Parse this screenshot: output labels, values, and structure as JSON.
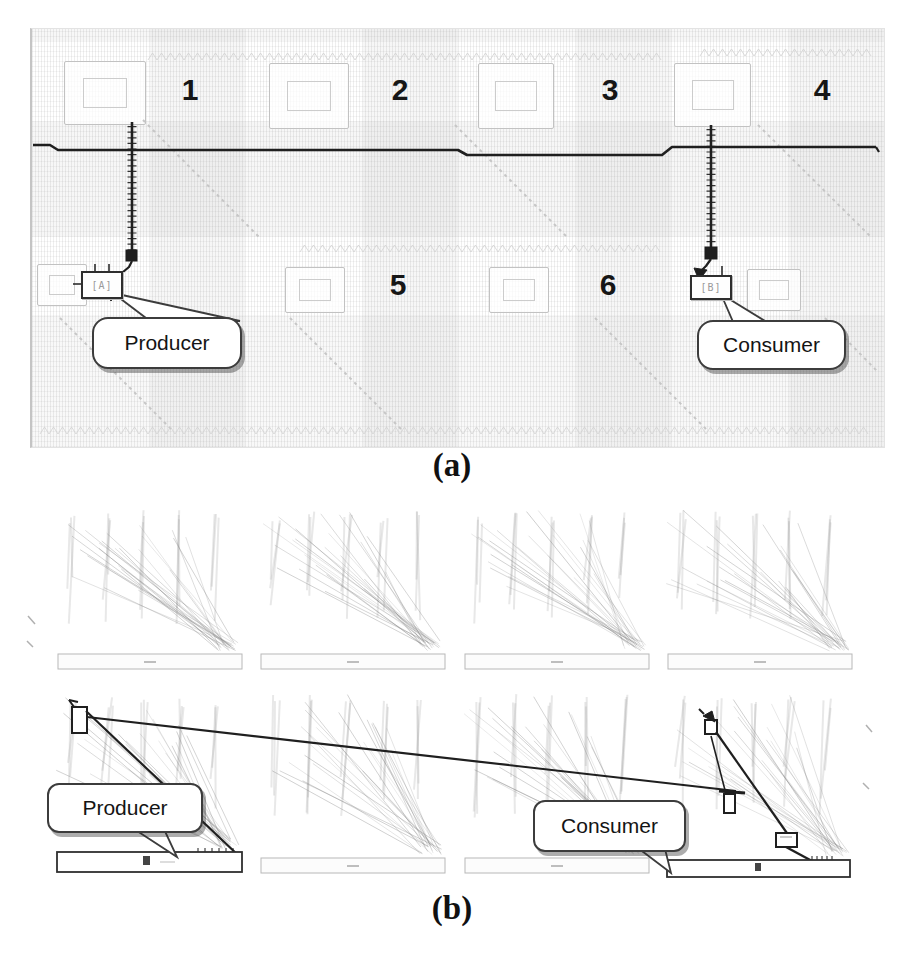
{
  "panel_a": {
    "tag": "(a)",
    "numbers": [
      "1",
      "2",
      "3",
      "4",
      "5",
      "6"
    ],
    "producer_block": "[A]",
    "consumer_block": "[B]",
    "producer_label": "Producer",
    "consumer_label": "Consumer"
  },
  "panel_b": {
    "tag": "(b)",
    "producer_label": "Producer",
    "consumer_label": "Consumer"
  },
  "colors": {
    "wire": "#1f1f1f",
    "bar_outline": "#2f2f2f",
    "faint_line": "#c6c6c6",
    "fan_line": "#9a9a9a",
    "callout_border": "#3c3c3c",
    "page_bg": "#ffffff"
  }
}
